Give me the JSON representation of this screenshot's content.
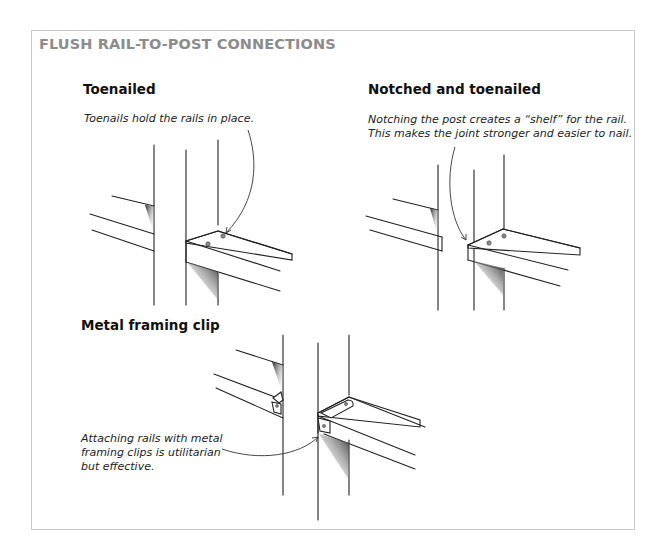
{
  "figure": {
    "title": "FLUSH RAIL-TO-POST CONNECTIONS",
    "colors": {
      "title": "#8c8c8c",
      "border": "#c9c9c9",
      "ink": "#222222"
    },
    "panels": [
      {
        "heading": "Toenailed",
        "caption": [
          "Toenails hold the rails in place."
        ],
        "illustration": "post-with-rails-toenailed"
      },
      {
        "heading": "Notched and toenailed",
        "caption": [
          "Notching the post creates a “shelf” for the rail.",
          "This makes the joint stronger and easier to nail."
        ],
        "illustration": "post-with-rails-notched"
      },
      {
        "heading": "Metal framing clip",
        "caption": [
          "Attaching rails with metal",
          "framing clips is utilitarian",
          "but effective."
        ],
        "illustration": "post-with-rails-metal-clips"
      }
    ]
  }
}
